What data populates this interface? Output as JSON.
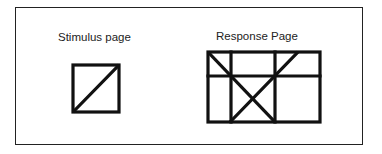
{
  "diagram": {
    "stimulus": {
      "label": "Stimulus page",
      "shape": "square-with-diagonal"
    },
    "response": {
      "label": "Response Page",
      "shape": "grid-with-crossing-diagonals"
    },
    "colors": {
      "stroke": "#111111",
      "background": "#ffffff"
    }
  }
}
